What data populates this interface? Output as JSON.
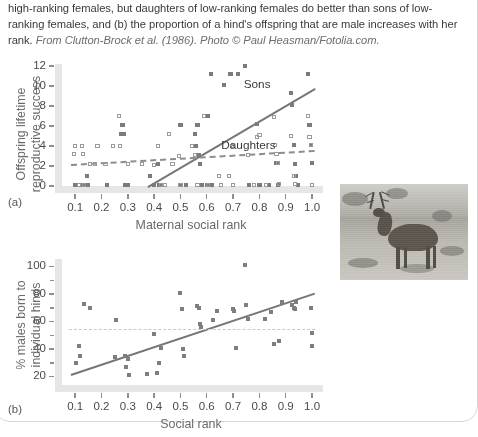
{
  "caption": {
    "text": "high-ranking females, but daughters of low-ranking females do better than sons of low-ranking females, and (b) the proportion of a hind's offspring that are male increases with her rank. ",
    "source": "From Clutton-Brock et al. (1986). Photo © Paul Heasman/Fotolia.com."
  },
  "photo": {
    "alt_name": "red-deer-stag-photo"
  },
  "chart_data": [
    {
      "type": "scatter",
      "panel": "(a)",
      "title": "",
      "xlabel": "Maternal social rank",
      "ylabel": "Offspring lifetime reproductive success",
      "xlim": [
        0.05,
        1.03
      ],
      "ylim": [
        0,
        12
      ],
      "xticks": [
        "0.1",
        "0.2",
        "0.3",
        "0.4",
        "0.5",
        "0.6",
        "0.7",
        "0.8",
        "0.9",
        "1.0"
      ],
      "xtickvals": [
        0.1,
        0.2,
        0.3,
        0.4,
        0.5,
        0.6,
        0.7,
        0.8,
        0.9,
        1.0
      ],
      "yticks": [
        "0",
        "2",
        "4",
        "6",
        "8",
        "10",
        "12"
      ],
      "ytickvals": [
        0,
        2,
        4,
        6,
        8,
        10,
        12
      ],
      "grid": false,
      "legend_position": "inline-annotations",
      "series": [
        {
          "name": "Sons",
          "marker": "filled-square",
          "color": "#7b7b7b",
          "label_x": 0.74,
          "label_y": 10.1,
          "points": [
            [
              0.1,
              0.1
            ],
            [
              0.13,
              0.1
            ],
            [
              0.145,
              1.0
            ],
            [
              0.15,
              0.1
            ],
            [
              0.22,
              0.1
            ],
            [
              0.275,
              5.2
            ],
            [
              0.28,
              6.1
            ],
            [
              0.285,
              5.2
            ],
            [
              0.29,
              0.1
            ],
            [
              0.3,
              0.1
            ],
            [
              0.385,
              1.0
            ],
            [
              0.4,
              0.1
            ],
            [
              0.415,
              2.2
            ],
            [
              0.42,
              0.1
            ],
            [
              0.43,
              0.1
            ],
            [
              0.5,
              6.1
            ],
            [
              0.5,
              0.1
            ],
            [
              0.52,
              0.1
            ],
            [
              0.555,
              5.2
            ],
            [
              0.56,
              4.0
            ],
            [
              0.565,
              6.1
            ],
            [
              0.57,
              3.1
            ],
            [
              0.575,
              2.2
            ],
            [
              0.58,
              0.1
            ],
            [
              0.6,
              0.1
            ],
            [
              0.605,
              7.0
            ],
            [
              0.615,
              11.2
            ],
            [
              0.62,
              0.1
            ],
            [
              0.665,
              10.1
            ],
            [
              0.69,
              11.2
            ],
            [
              0.72,
              11.2
            ],
            [
              0.745,
              12.0
            ],
            [
              0.76,
              0.1
            ],
            [
              0.79,
              6.2
            ],
            [
              0.8,
              0.1
            ],
            [
              0.835,
              0.1
            ],
            [
              0.865,
              2.3
            ],
            [
              0.87,
              0.1
            ],
            [
              0.92,
              9.3
            ],
            [
              0.925,
              8.1
            ],
            [
              0.93,
              4.1
            ],
            [
              0.935,
              2.2
            ],
            [
              0.94,
              1.0
            ],
            [
              0.945,
              0.1
            ],
            [
              0.985,
              11.2
            ],
            [
              0.99,
              6.1
            ],
            [
              0.995,
              4.1
            ],
            [
              1.0,
              2.3
            ]
          ]
        },
        {
          "name": "Daughters",
          "marker": "open-square",
          "color": "#9a9a9a",
          "label_x": 0.655,
          "label_y": 4.0,
          "points": [
            [
              0.095,
              3.2
            ],
            [
              0.1,
              4.0
            ],
            [
              0.115,
              0.1
            ],
            [
              0.125,
              4.0
            ],
            [
              0.13,
              3.2
            ],
            [
              0.135,
              0.1
            ],
            [
              0.155,
              2.2
            ],
            [
              0.175,
              2.2
            ],
            [
              0.185,
              4.0
            ],
            [
              0.215,
              2.2
            ],
            [
              0.245,
              4.0
            ],
            [
              0.265,
              7.0
            ],
            [
              0.27,
              4.0
            ],
            [
              0.3,
              2.2
            ],
            [
              0.355,
              2.2
            ],
            [
              0.4,
              2.1
            ],
            [
              0.415,
              4.0
            ],
            [
              0.425,
              0.1
            ],
            [
              0.44,
              0.1
            ],
            [
              0.455,
              5.2
            ],
            [
              0.47,
              2.2
            ],
            [
              0.495,
              3.0
            ],
            [
              0.5,
              0.1
            ],
            [
              0.545,
              4.0
            ],
            [
              0.555,
              3.1
            ],
            [
              0.565,
              0.1
            ],
            [
              0.59,
              7.0
            ],
            [
              0.605,
              0.1
            ],
            [
              0.645,
              1.0
            ],
            [
              0.655,
              0.1
            ],
            [
              0.685,
              1.0
            ],
            [
              0.695,
              4.0
            ],
            [
              0.7,
              0.1
            ],
            [
              0.755,
              3.1
            ],
            [
              0.78,
              0.1
            ],
            [
              0.79,
              4.9
            ],
            [
              0.8,
              5.1
            ],
            [
              0.825,
              0.1
            ],
            [
              0.855,
              6.9
            ],
            [
              0.86,
              4.1
            ],
            [
              0.865,
              3.2
            ],
            [
              0.87,
              2.3
            ],
            [
              0.875,
              0.2
            ],
            [
              0.92,
              5.0
            ],
            [
              0.93,
              1.0
            ],
            [
              0.935,
              0.2
            ],
            [
              0.985,
              7.0
            ],
            [
              0.99,
              4.9
            ],
            [
              0.995,
              4.1
            ],
            [
              1.0,
              0.1
            ]
          ]
        }
      ],
      "trendlines": [
        {
          "name": "Sons trend",
          "style": "solid",
          "x0": 0.375,
          "y0": 0.0,
          "x1": 1.01,
          "y1": 9.8,
          "color": "#767676"
        },
        {
          "name": "Daughters trend",
          "style": "dashed",
          "x0": 0.085,
          "y0": 2.2,
          "x1": 1.01,
          "y1": 3.6,
          "color": "#8d8d8d"
        }
      ]
    },
    {
      "type": "scatter",
      "panel": "(b)",
      "title": "",
      "xlabel": "Social rank",
      "ylabel": "% males born to individual hinds",
      "xlim": [
        0.05,
        1.03
      ],
      "ylim": [
        14,
        104
      ],
      "xticks": [
        "0.1",
        "0.2",
        "0.3",
        "0.4",
        "0.5",
        "0.6",
        "0.7",
        "0.8",
        "0.9",
        "1.0"
      ],
      "xtickvals": [
        0.1,
        0.2,
        0.3,
        0.4,
        0.5,
        0.6,
        0.7,
        0.8,
        0.9,
        1.0
      ],
      "yticks": [
        "20",
        "40",
        "60",
        "80",
        "100"
      ],
      "ytickvals": [
        20,
        40,
        60,
        80,
        100
      ],
      "yminorticks": [
        30,
        50,
        70,
        90
      ],
      "grid": false,
      "legend_position": "none",
      "series": [
        {
          "name": "% males born",
          "marker": "filled-square",
          "color": "#7e7e7e",
          "points": [
            [
              0.105,
              30
            ],
            [
              0.115,
              42
            ],
            [
              0.12,
              35
            ],
            [
              0.135,
              73
            ],
            [
              0.155,
              70
            ],
            [
              0.25,
              34
            ],
            [
              0.255,
              61
            ],
            [
              0.29,
              35
            ],
            [
              0.295,
              27
            ],
            [
              0.3,
              33
            ],
            [
              0.305,
              21
            ],
            [
              0.375,
              22
            ],
            [
              0.4,
              51
            ],
            [
              0.41,
              23
            ],
            [
              0.42,
              30
            ],
            [
              0.425,
              41
            ],
            [
              0.5,
              81
            ],
            [
              0.505,
              69
            ],
            [
              0.51,
              40
            ],
            [
              0.515,
              35
            ],
            [
              0.565,
              71
            ],
            [
              0.57,
              70
            ],
            [
              0.575,
              58
            ],
            [
              0.58,
              56
            ],
            [
              0.625,
              61
            ],
            [
              0.64,
              68
            ],
            [
              0.7,
              69
            ],
            [
              0.705,
              68
            ],
            [
              0.71,
              41
            ],
            [
              0.745,
              101
            ],
            [
              0.75,
              72
            ],
            [
              0.755,
              62
            ],
            [
              0.82,
              62
            ],
            [
              0.845,
              67
            ],
            [
              0.855,
              44
            ],
            [
              0.875,
              46
            ],
            [
              0.885,
              74
            ],
            [
              0.925,
              72
            ],
            [
              0.93,
              70
            ],
            [
              0.935,
              69
            ],
            [
              0.94,
              74
            ],
            [
              0.995,
              70
            ],
            [
              1.0,
              52
            ],
            [
              1.0,
              42
            ]
          ]
        }
      ],
      "trendlines": [
        {
          "name": "Social rank trend",
          "style": "solid",
          "x0": 0.085,
          "y0": 22,
          "x1": 1.01,
          "y1": 81,
          "color": "#767676"
        },
        {
          "name": "Equal sex ratio reference",
          "style": "dashed-flat",
          "x0": 0.075,
          "y0": 55,
          "x1": 1.01,
          "y1": 55,
          "color": "#c9c9c9"
        }
      ]
    }
  ]
}
